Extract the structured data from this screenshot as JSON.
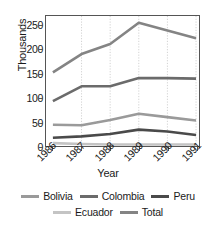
{
  "chart_data": {
    "type": "line",
    "title": "",
    "xlabel": "Year",
    "ylabel": "Thousands",
    "categories": [
      "1986",
      "1987",
      "1988",
      "1989",
      "1990",
      "1991"
    ],
    "ylim": [
      0,
      270
    ],
    "yticks": [
      0,
      50,
      100,
      150,
      200,
      250
    ],
    "ytick_labels": [
      "0",
      "50",
      "100",
      "150",
      "200",
      "250"
    ],
    "grid": "vertical-dotted",
    "legend_position": "bottom",
    "series": [
      {
        "name": "Bolivia",
        "color": "#9a9a9a",
        "values": [
          44,
          43,
          54,
          67,
          60,
          53
        ]
      },
      {
        "name": "Colombia",
        "color": "#6b6b6b",
        "values": [
          93,
          124,
          124,
          141,
          141,
          140
        ]
      },
      {
        "name": "Peru",
        "color": "#4a4a4a",
        "values": [
          17,
          20,
          25,
          34,
          30,
          23
        ]
      },
      {
        "name": "Ecuador",
        "color": "#c4c4c4",
        "values": [
          6,
          4,
          3,
          3,
          3,
          3
        ]
      },
      {
        "name": "Total",
        "color": "#848484",
        "values": [
          153,
          191,
          212,
          256,
          240,
          224
        ]
      }
    ]
  },
  "legend": {
    "rows": [
      [
        "Bolivia",
        "Colombia",
        "Peru"
      ],
      [
        "Ecuador",
        "Total"
      ]
    ]
  },
  "axes": {
    "y_title": "Thousands",
    "x_title": "Year"
  }
}
